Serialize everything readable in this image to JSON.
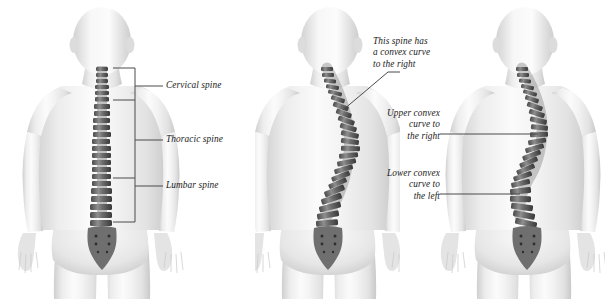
{
  "figure": {
    "type": "medical-illustration",
    "background_color": "#ffffff",
    "label_color": "#1a1a1a",
    "leader_color": "#4a4a4a",
    "panel_count": 3
  },
  "panels": [
    {
      "id": "normal-spine",
      "position": "left",
      "description": "Posterior view of body with normal straight spine and region brackets",
      "labels": [
        {
          "name": "cervical",
          "text": "Cervical spine"
        },
        {
          "name": "thoracic",
          "text": "Thoracic spine"
        },
        {
          "name": "lumbar",
          "text": "Lumbar spine"
        }
      ]
    },
    {
      "id": "c-curve-spine",
      "position": "middle",
      "description": "Posterior view of body with single convex right curve",
      "annotation": {
        "name": "convex-right",
        "lines": [
          "This spine has",
          "a convex curve",
          "to the right"
        ]
      }
    },
    {
      "id": "s-curve-spine",
      "position": "right",
      "description": "Posterior view of body with double S-shaped curve",
      "annotations": [
        {
          "name": "upper-convex-right",
          "lines": [
            "Upper convex",
            "curve to",
            "the right"
          ]
        },
        {
          "name": "lower-convex-left",
          "lines": [
            "Lower convex",
            "curve to",
            "the left"
          ]
        }
      ]
    }
  ]
}
